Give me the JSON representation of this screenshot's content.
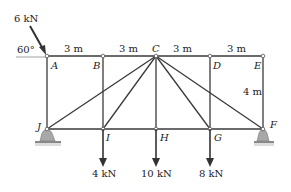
{
  "diagram": {
    "type": "truss",
    "nodes": {
      "top": [
        "A",
        "B",
        "C",
        "D",
        "E"
      ],
      "bottom": [
        "J",
        "I",
        "H",
        "G",
        "F"
      ]
    },
    "dimensions": {
      "spans": [
        "3 m",
        "3 m",
        "3 m",
        "3 m"
      ],
      "height": "4 m"
    },
    "loads": {
      "applied_at_A": "6 kN",
      "angle": "60°",
      "at_I": "4 kN",
      "at_H": "10 kN",
      "at_G": "8 kN"
    },
    "supports": [
      "J",
      "F"
    ],
    "colors": {
      "member": "#3a3a3a",
      "support": "#9a9a9a",
      "ground": "#b0b0b0"
    }
  }
}
